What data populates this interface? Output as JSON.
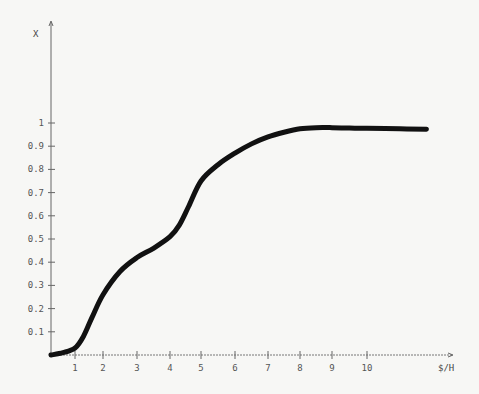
{
  "chart_data": {
    "type": "line",
    "title": "",
    "xlabel": "$/H",
    "ylabel": "X",
    "x_ticks": [
      "1",
      "2",
      "3",
      "4",
      "5",
      "6",
      "7",
      "8",
      "9",
      "10"
    ],
    "y_ticks": [
      "0.1",
      "0.2",
      "0.3",
      "0.4",
      "0.5",
      "0.6",
      "0.7",
      "0.8",
      "0.9",
      "1"
    ],
    "xlim": [
      0,
      12.2
    ],
    "ylim": [
      0,
      1
    ],
    "grid": false,
    "legend": null,
    "series": [
      {
        "name": "X",
        "x": [
          0,
          0.5,
          1.0,
          1.3,
          1.6,
          2.0,
          2.5,
          3.0,
          3.5,
          4.0,
          4.3,
          4.6,
          5.0,
          5.5,
          6.0,
          6.5,
          7.0,
          7.5,
          8.0,
          8.5,
          9.0,
          9.5,
          10.0,
          11.0,
          11.8
        ],
        "y": [
          0.0,
          0.01,
          0.03,
          0.08,
          0.16,
          0.26,
          0.36,
          0.42,
          0.46,
          0.51,
          0.56,
          0.64,
          0.75,
          0.82,
          0.87,
          0.91,
          0.94,
          0.96,
          0.975,
          0.98,
          0.98,
          0.978,
          0.977,
          0.975,
          0.973
        ]
      }
    ]
  }
}
